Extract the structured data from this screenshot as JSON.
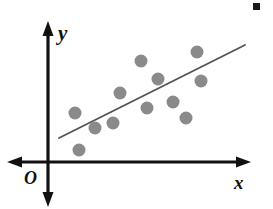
{
  "chart_data": {
    "type": "scatter",
    "title": "",
    "subtitle": "",
    "xlabel": "x",
    "ylabel": "y",
    "origin_label": "O",
    "legend": [],
    "grid": false,
    "axis_style": "arrow-axes-four-way",
    "xlim": [
      0,
      273
    ],
    "ylim": [
      0,
      209
    ],
    "point_color": "#8a8a8a",
    "point_radius": 6.5,
    "axis_color": "#111111",
    "trend_line_color": "#555555",
    "annotation_mark_color": "#1a1a1a",
    "points": [
      {
        "x": 75,
        "y": 113
      },
      {
        "x": 79,
        "y": 150
      },
      {
        "x": 95,
        "y": 128
      },
      {
        "x": 113,
        "y": 123
      },
      {
        "x": 120,
        "y": 93
      },
      {
        "x": 141,
        "y": 61
      },
      {
        "x": 147,
        "y": 108
      },
      {
        "x": 158,
        "y": 79
      },
      {
        "x": 173,
        "y": 102
      },
      {
        "x": 197,
        "y": 52
      },
      {
        "x": 201,
        "y": 81
      },
      {
        "x": 186,
        "y": 118
      }
    ],
    "trend_line": {
      "x1": 59,
      "y1": 138,
      "x2": 245,
      "y2": 45
    },
    "axes": {
      "y_axis": {
        "x": 48,
        "y_top": 22,
        "y_bottom": 207
      },
      "x_axis": {
        "y": 162,
        "x_left": 8,
        "x_right": 250
      }
    },
    "annotation_mark": {
      "x": 253,
      "y": 3,
      "size": 7
    }
  },
  "labels": {
    "y_axis": "y",
    "x_axis": "x",
    "origin": "O"
  }
}
